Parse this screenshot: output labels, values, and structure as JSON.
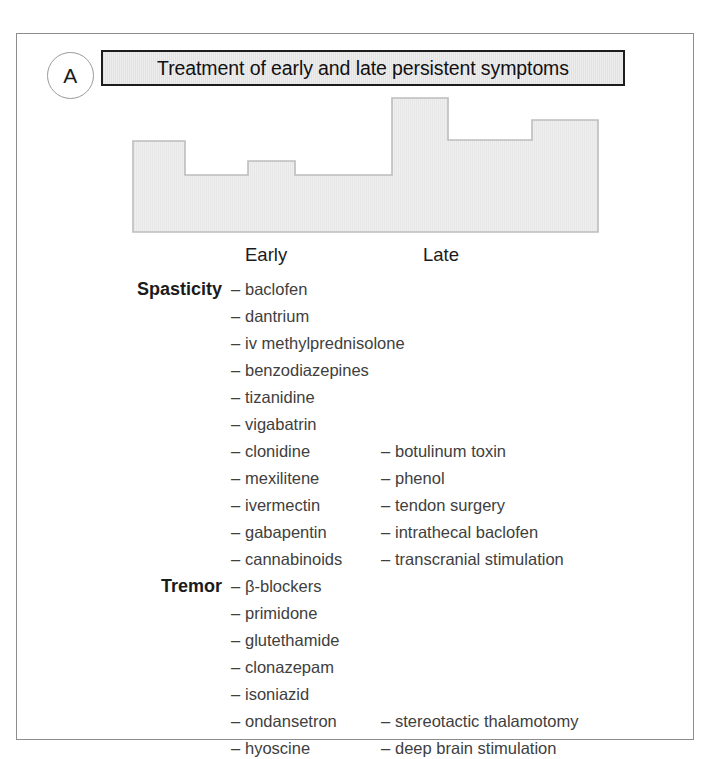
{
  "panel": {
    "letter": "A"
  },
  "title": {
    "text": "Treatment of early and late persistent symptoms"
  },
  "columns": {
    "early_label": "Early",
    "late_label": "Late"
  },
  "sections": {
    "spasticity_label": "Spasticity",
    "tremor_label": "Tremor"
  },
  "dash": "–",
  "rows": [
    {
      "label": "Spasticity",
      "early": "baclofen",
      "late": ""
    },
    {
      "label": "",
      "early": "dantrium",
      "late": ""
    },
    {
      "label": "",
      "early": "iv methylprednisolone",
      "late": ""
    },
    {
      "label": "",
      "early": "benzodiazepines",
      "late": ""
    },
    {
      "label": "",
      "early": "tizanidine",
      "late": ""
    },
    {
      "label": "",
      "early": "vigabatrin",
      "late": ""
    },
    {
      "label": "",
      "early": "clonidine",
      "late": "botulinum toxin"
    },
    {
      "label": "",
      "early": "mexilitene",
      "late": "phenol"
    },
    {
      "label": "",
      "early": "ivermectin",
      "late": "tendon surgery"
    },
    {
      "label": "",
      "early": "gabapentin",
      "late": "intrathecal baclofen"
    },
    {
      "label": "",
      "early": "cannabinoids",
      "late": "transcranial stimulation"
    },
    {
      "label": "Tremor",
      "early": "β-blockers",
      "late": ""
    },
    {
      "label": "",
      "early": "primidone",
      "late": ""
    },
    {
      "label": "",
      "early": "glutethamide",
      "late": ""
    },
    {
      "label": "",
      "early": "clonazepam",
      "late": ""
    },
    {
      "label": "",
      "early": "isoniazid",
      "late": ""
    },
    {
      "label": "",
      "early": "ondansetron",
      "late": "stereotactic thalamotomy"
    },
    {
      "label": "",
      "early": "hyoscine",
      "late": "deep brain stimulation"
    },
    {
      "label": "",
      "early": "carbamazepine",
      "late": "physical restraint"
    }
  ],
  "chart_data": {
    "type": "bar",
    "title": "",
    "xlabel": "",
    "ylabel": "",
    "note": "stepped silhouette block (obscured/greyed bar profile)",
    "categories": [
      "s1",
      "s2",
      "s3",
      "s4",
      "s5",
      "s6",
      "s7"
    ],
    "values": [
      64,
      38,
      52,
      38,
      100,
      72,
      85
    ],
    "ylim": [
      0,
      100
    ],
    "grid": false,
    "fill_color": "#ededed",
    "stroke_color": "#bdbdbd",
    "segments": [
      {
        "x0": 0,
        "x1": 53,
        "top": 47
      },
      {
        "x0": 53,
        "x1": 116,
        "top": 81
      },
      {
        "x0": 116,
        "x1": 163,
        "top": 67
      },
      {
        "x0": 163,
        "x1": 260,
        "top": 81
      },
      {
        "x0": 260,
        "x1": 316,
        "top": 4
      },
      {
        "x0": 316,
        "x1": 400,
        "top": 46
      },
      {
        "x0": 400,
        "x1": 466,
        "top": 26
      }
    ],
    "baseline": 138
  },
  "colors": {
    "frame_border": "#8d8d8d",
    "title_border": "#1d1d1d",
    "title_fill": "#e8e8e8",
    "text_dark": "#1b1b1b",
    "text_body": "#404040",
    "shape_fill": "#ededed",
    "shape_stroke": "#bdbdbd"
  }
}
